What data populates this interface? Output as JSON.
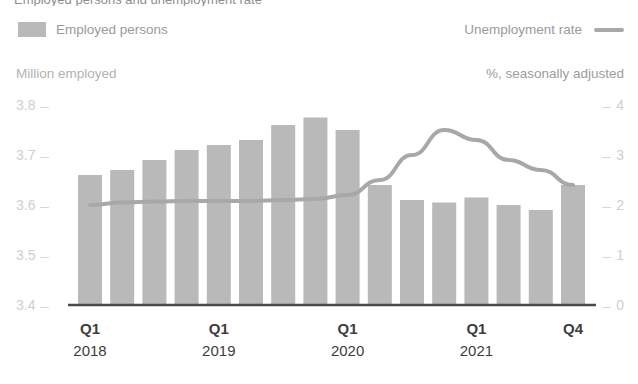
{
  "title_clipped": "Employed persons and unemployment rate",
  "legend": {
    "bar_label": "Employed persons",
    "bar_icon": "square-swatch-icon",
    "line_label": "Unemployment rate",
    "line_icon": "line-swatch-icon"
  },
  "axes": {
    "left_title": "Million employed",
    "right_title": "%, seasonally adjusted",
    "left_ticks": [
      "3.8",
      "3.7",
      "3.6",
      "3.5",
      "3.4"
    ],
    "right_ticks": [
      "4",
      "3",
      "2",
      "1",
      "0"
    ],
    "x_labels": [
      {
        "quarter": "Q1",
        "year": "2018"
      },
      {
        "quarter": "Q1",
        "year": "2019"
      },
      {
        "quarter": "Q1",
        "year": "2020"
      },
      {
        "quarter": "Q1",
        "year": "2021"
      },
      {
        "quarter": "Q4",
        "year": ""
      }
    ]
  },
  "colors": {
    "bar_fill": "#b9b9b9",
    "line_stroke": "#a8a8a8",
    "axis_line": "#4a4a4a",
    "tick_text": "#cfcfcf",
    "label_text": "#3d3d3d"
  },
  "chart_data": {
    "type": "bar",
    "title": "Employed persons and unemployment rate",
    "xlabel": "",
    "ylabel": "Million employed",
    "y2label": "%, seasonally adjusted",
    "ylim": [
      3.4,
      3.8
    ],
    "y2lim": [
      0,
      4
    ],
    "grid": false,
    "legend_position": "top",
    "categories": [
      "Q1 2018",
      "Q2 2018",
      "Q3 2018",
      "Q4 2018",
      "Q1 2019",
      "Q2 2019",
      "Q3 2019",
      "Q4 2019",
      "Q1 2020",
      "Q2 2020",
      "Q3 2020",
      "Q4 2020",
      "Q1 2021",
      "Q2 2021",
      "Q3 2021",
      "Q4 2021"
    ],
    "series": [
      {
        "name": "Employed persons",
        "type": "bar",
        "axis": "left",
        "unit": "million",
        "values": [
          3.66,
          3.67,
          3.69,
          3.71,
          3.72,
          3.73,
          3.76,
          3.775,
          3.75,
          3.64,
          3.61,
          3.605,
          3.615,
          3.6,
          3.59,
          3.64
        ]
      },
      {
        "name": "Unemployment rate",
        "type": "line",
        "axis": "right",
        "unit": "%",
        "values": [
          2.0,
          2.05,
          2.07,
          2.08,
          2.08,
          2.08,
          2.1,
          2.12,
          2.2,
          2.5,
          3.0,
          3.5,
          3.3,
          2.9,
          2.7,
          2.4
        ]
      }
    ]
  }
}
